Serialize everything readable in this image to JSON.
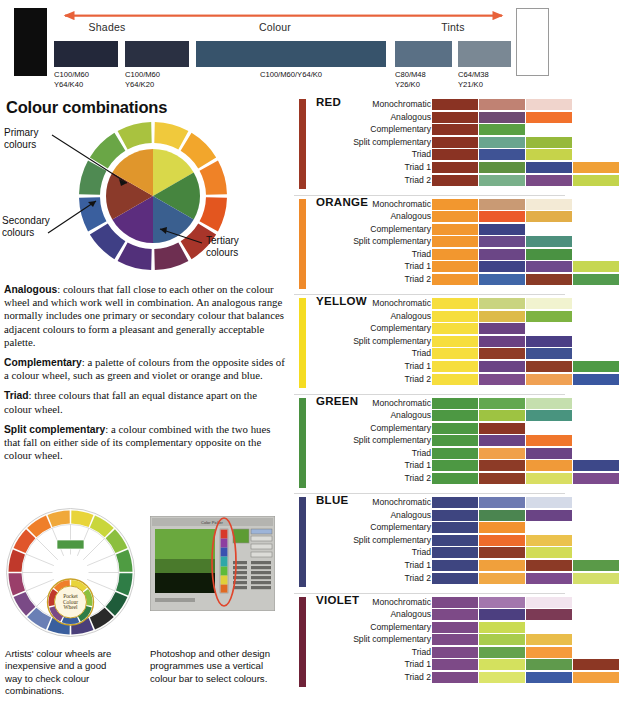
{
  "tone_banner": {
    "arrow_color": "#e8623a",
    "endcaps": [
      {
        "name": "black-endcap",
        "color": "#0d0d0d"
      },
      {
        "name": "white-endcap",
        "color": "#ffffff"
      }
    ],
    "group_labels": [
      "Shades",
      "Colour",
      "Tints"
    ],
    "swatches": [
      {
        "caption": "C100/M60\nY64/K40",
        "color": "#23283a"
      },
      {
        "caption": "C100/M60\nY64/K20",
        "color": "#2a3042"
      },
      {
        "caption": "C100/M60/Y64/K0",
        "color": "#37536b"
      },
      {
        "caption": "C80/M48\nY26/K0",
        "color": "#5a7085"
      },
      {
        "caption": "C64/M38\nY21/K0",
        "color": "#7a8894"
      }
    ]
  },
  "left": {
    "title": "Colour combinations",
    "wheel_notes": {
      "primary": "Primary\ncolours",
      "secondary": "Secondary\ncolours",
      "tertiary": "Tertiary\ncolours"
    },
    "wheel_inner_colors": [
      "#d9d84a",
      "#46853f",
      "#3a5f8f",
      "#5c2d7e",
      "#8b3a2a",
      "#e0962c"
    ],
    "wheel_outer_colors": [
      "#f0c93c",
      "#f2a62c",
      "#ef8227",
      "#e3561f",
      "#a8352a",
      "#6e2f51",
      "#52307a",
      "#3f3f85",
      "#3a5f9e",
      "#4f8a52",
      "#6aa646",
      "#a9c23f"
    ],
    "definitions": [
      {
        "term": "Analogous",
        "text": ": colours that fall close to each other on the colour wheel and which work well in combination. An analogous range normally includes one primary or secondary colour that balances adjacent colours to form a pleasant and generally acceptable palette."
      },
      {
        "term": "Complementary",
        "text": ": a palette of colours from the opposite sides of a colour wheel, such as green and violet or orange and blue."
      },
      {
        "term": "Triad",
        "text": ": three colours that fall an equal distance apart on the colour wheel."
      },
      {
        "term": "Split complementary",
        "text": ": a colour combined with the two hues that fall on either side of its complementary opposite on the colour wheel."
      }
    ],
    "figures": [
      {
        "name": "artists-colour-wheel",
        "caption": "Artists' colour wheels are inexpensive and a good way to check colour combinations.",
        "center_label": "Pocket\nColour\nWheel"
      },
      {
        "name": "photoshop-colour-picker",
        "caption": "Photoshop and other design programmes use a vertical colour bar to select colours.",
        "dialog_title": "Color Picker",
        "buttons": [
          "OK",
          "Cancel",
          "Add To Swatches",
          "Color Libraries"
        ],
        "highlight_color": "#e0452b"
      }
    ]
  },
  "scheme_labels": [
    "Monochromatic",
    "Analogous",
    "Complementary",
    "Split complementary",
    "Triad",
    "Triad 1",
    "Triad 2"
  ],
  "chart_data": {
    "type": "table",
    "row_labels": [
      "Monochromatic",
      "Analogous",
      "Complementary",
      "Split complementary",
      "Triad",
      "Triad 1",
      "Triad 2"
    ],
    "panels": [
      {
        "hue": "RED",
        "bar_color": "#9c3724",
        "rows": [
          [
            "#8a3323",
            "#c08273",
            "#f0d4cc"
          ],
          [
            "#8a3323",
            "#6e4a72",
            "#f2712c"
          ],
          [
            "#8a3323",
            "#5aa043"
          ],
          [
            "#8a3323",
            "#6aa58e",
            "#96b93c"
          ],
          [
            "#8a3323",
            "#3f5395",
            "#c6d34a"
          ],
          [
            "#8a3323",
            "#5f9140",
            "#3b4a8c",
            "#f0a036"
          ],
          [
            "#8a3323",
            "#79b08a",
            "#7a4a86",
            "#c3d44c"
          ]
        ]
      },
      {
        "hue": "ORANGE",
        "bar_color": "#ef8a2a",
        "rows": [
          [
            "#f2972f",
            "#c99a74",
            "#f3ead5"
          ],
          [
            "#f2972f",
            "#ec5a2b",
            "#e2ae48"
          ],
          [
            "#f2972f",
            "#3c4285"
          ],
          [
            "#f2972f",
            "#6a4a8a",
            "#4d907d"
          ],
          [
            "#f2972f",
            "#6b4686",
            "#4a9242"
          ],
          [
            "#f2972f",
            "#3f4487",
            "#6e4a8c",
            "#c6d752"
          ],
          [
            "#f2972f",
            "#4066a8",
            "#8a3b26",
            "#539b4e"
          ]
        ]
      },
      {
        "hue": "YELLOW",
        "bar_color": "#f5dc22",
        "rows": [
          [
            "#f6de3e",
            "#c9d480",
            "#f1f3cf"
          ],
          [
            "#f6de3e",
            "#ddbb4a",
            "#7eb342"
          ],
          [
            "#f6de3e",
            "#6b4382"
          ],
          [
            "#f6de3e",
            "#6a4183",
            "#4b3e85"
          ],
          [
            "#f6de3e",
            "#8f3b27",
            "#3f5191"
          ],
          [
            "#f6de3e",
            "#6b4485",
            "#8e3c26",
            "#4e9a45"
          ],
          [
            "#f6de3e",
            "#7d4c8c",
            "#f0a154",
            "#3a57a0"
          ]
        ]
      },
      {
        "hue": "GREEN",
        "bar_color": "#4a9141",
        "rows": [
          [
            "#4d9843",
            "#63a850",
            "#c5dfae"
          ],
          [
            "#4d9843",
            "#9ec342",
            "#49947f"
          ],
          [
            "#4d9843",
            "#8c3624"
          ],
          [
            "#4d9843",
            "#6a4484",
            "#f0762c"
          ],
          [
            "#4d9843",
            "#f0a04a",
            "#6b4485"
          ],
          [
            "#4d9843",
            "#8d3b27",
            "#f09a39",
            "#3d4889"
          ],
          [
            "#4d9843",
            "#8e3c26",
            "#d9de62",
            "#7c4b8d"
          ]
        ]
      },
      {
        "hue": "BLUE",
        "bar_color": "#3b3f72",
        "rows": [
          [
            "#3e4580",
            "#6d7ab2",
            "#d4dae8"
          ],
          [
            "#3e4580",
            "#4b8550",
            "#6a4485"
          ],
          [
            "#3e4580",
            "#f2922f"
          ],
          [
            "#3e4580",
            "#ee6c2a",
            "#ebc24d"
          ],
          [
            "#3e4580",
            "#8d3b27",
            "#d2dc57"
          ],
          [
            "#3e4580",
            "#f0a03c",
            "#8c3a26",
            "#5a9a48"
          ],
          [
            "#3e4580",
            "#f0a845",
            "#7c4b8d",
            "#d4df6a"
          ]
        ]
      },
      {
        "hue": "VIOLET",
        "bar_color": "#6f2238",
        "rows": [
          [
            "#7d4a87",
            "#a377ad",
            "#f2e4ee"
          ],
          [
            "#7d4a87",
            "#4c3f80",
            "#7c3a55"
          ],
          [
            "#7d4a87",
            "#cadb52"
          ],
          [
            "#7d4a87",
            "#a9cc4d",
            "#e9bd4b"
          ],
          [
            "#7d4a87",
            "#64a24c",
            "#f59b3c"
          ],
          [
            "#7d4a87",
            "#d4e15e",
            "#5f9a4c",
            "#8c3724"
          ],
          [
            "#7d4a87",
            "#dce56b",
            "#3d5ba3",
            "#f3a13f"
          ]
        ]
      }
    ]
  }
}
